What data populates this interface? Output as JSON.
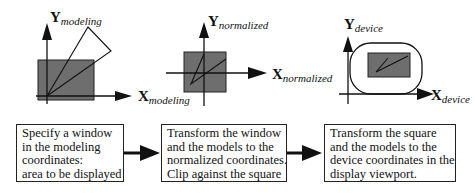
{
  "panels": [
    {
      "id": "modeling",
      "x_axis": {
        "main": "X",
        "sub": "modeling"
      },
      "y_axis": {
        "main": "Y",
        "sub": "modeling"
      }
    },
    {
      "id": "normalized",
      "x_axis": {
        "main": "X",
        "sub": "normalized"
      },
      "y_axis": {
        "main": "Y",
        "sub": "normalized"
      }
    },
    {
      "id": "device",
      "x_axis": {
        "main": "X",
        "sub": "device"
      },
      "y_axis": {
        "main": "Y",
        "sub": "device"
      }
    }
  ],
  "steps": [
    {
      "lines": [
        "Specify a window",
        "in the modeling",
        "coordinates:",
        "area to be displayed"
      ]
    },
    {
      "lines": [
        "Transform the window",
        "and the models to the",
        "normalized coordinates.",
        "Clip against the square"
      ]
    },
    {
      "lines": [
        "Transform the square",
        "and the models to the",
        "device coordinates in the",
        "display viewport."
      ]
    }
  ],
  "colors": {
    "fill": "#6e6e6e",
    "stroke": "#111111"
  }
}
